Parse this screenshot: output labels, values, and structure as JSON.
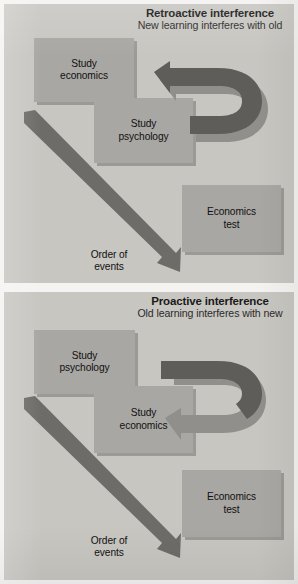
{
  "figure": {
    "background_color": "#f4f3f1",
    "panel_color": "#c8c6c1",
    "box_color": "#a9a7a3",
    "arrow_dark_color": "#6e6c68",
    "arrow_light_color": "#8e8c88",
    "text_color": "#111111"
  },
  "panels": [
    {
      "id": "retroactive",
      "heading": {
        "title": "Retroactive interference",
        "subtitle": "New learning interferes with old"
      },
      "boxes": [
        {
          "id": "box-1",
          "line1": "Study",
          "line2": "economics"
        },
        {
          "id": "box-2",
          "line1": "Study",
          "line2": "psychology"
        },
        {
          "id": "box-3",
          "line1": "Economics",
          "line2": "test"
        }
      ],
      "order_label": {
        "line1": "Order of",
        "line2": "events"
      },
      "interference_arrow": {
        "name": "retroactive-interference-arrow",
        "direction": "points-left-at-top",
        "from_box": "box-2",
        "to_box": "box-1"
      },
      "timeline_arrow": {
        "name": "order-of-events-arrow",
        "direction": "diagonal-down-right"
      }
    },
    {
      "id": "proactive",
      "heading": {
        "title": "Proactive interference",
        "subtitle": "Old learning interferes with new"
      },
      "boxes": [
        {
          "id": "box-1",
          "line1": "Study",
          "line2": "psychology"
        },
        {
          "id": "box-2",
          "line1": "Study",
          "line2": "economics"
        },
        {
          "id": "box-3",
          "line1": "Economics",
          "line2": "test"
        }
      ],
      "order_label": {
        "line1": "Order of",
        "line2": "events"
      },
      "interference_arrow": {
        "name": "proactive-interference-arrow",
        "direction": "points-left-at-bottom",
        "from_box": "box-1",
        "to_box": "box-2"
      },
      "timeline_arrow": {
        "name": "order-of-events-arrow",
        "direction": "diagonal-down-right"
      }
    }
  ]
}
